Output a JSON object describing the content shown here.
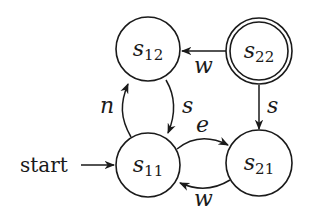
{
  "diagram": {
    "type": "finite-state-automaton",
    "start_label": "start",
    "states": [
      {
        "id": "s11",
        "base": "s",
        "sub": "11",
        "cx": 148,
        "cy": 165,
        "accepting": false,
        "initial": true
      },
      {
        "id": "s12",
        "base": "s",
        "sub": "12",
        "cx": 148,
        "cy": 49,
        "accepting": false,
        "initial": false
      },
      {
        "id": "s21",
        "base": "s",
        "sub": "21",
        "cx": 259,
        "cy": 163,
        "accepting": false,
        "initial": false
      },
      {
        "id": "s22",
        "base": "s",
        "sub": "22",
        "cx": 259,
        "cy": 51,
        "accepting": true,
        "initial": false
      }
    ],
    "transitions": [
      {
        "from": "s11",
        "to": "s12",
        "label": "n"
      },
      {
        "from": "s12",
        "to": "s11",
        "label": "s"
      },
      {
        "from": "s11",
        "to": "s21",
        "label": "e"
      },
      {
        "from": "s21",
        "to": "s11",
        "label": "w"
      },
      {
        "from": "s22",
        "to": "s12",
        "label": "w"
      },
      {
        "from": "s22",
        "to": "s21",
        "label": "s"
      }
    ],
    "colors": {
      "stroke": "#1a1a1a",
      "background": "#ffffff"
    }
  }
}
